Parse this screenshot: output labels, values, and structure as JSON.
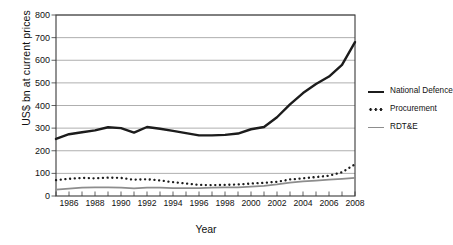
{
  "chart_data": {
    "type": "line",
    "title": "",
    "xlabel": "Year",
    "ylabel": "US$ bn at current prices",
    "ylim": [
      0,
      800
    ],
    "yticks": [
      0,
      100,
      200,
      300,
      400,
      500,
      600,
      700,
      800
    ],
    "xlim": [
      1985,
      2008
    ],
    "xticks": [
      1986,
      1988,
      1990,
      1992,
      1994,
      1996,
      1998,
      2000,
      2002,
      2004,
      2006,
      2008
    ],
    "x": [
      1985,
      1986,
      1987,
      1988,
      1989,
      1990,
      1991,
      1992,
      1993,
      1994,
      1995,
      1996,
      1997,
      1998,
      1999,
      2000,
      2001,
      2002,
      2003,
      2004,
      2005,
      2006,
      2007,
      2008
    ],
    "grid": "horizontal",
    "legend_position": "right",
    "series": [
      {
        "name": "National Defence",
        "style": "solid-thick",
        "color": "#1c1c1c",
        "values": [
          252,
          273,
          282,
          290,
          304,
          300,
          280,
          305,
          297,
          288,
          278,
          268,
          268,
          270,
          276,
          295,
          305,
          348,
          405,
          455,
          495,
          528,
          580,
          680
        ]
      },
      {
        "name": "Procurement",
        "style": "dotted",
        "color": "#1c1c1c",
        "values": [
          70,
          76,
          80,
          78,
          81,
          80,
          72,
          74,
          69,
          61,
          55,
          49,
          48,
          49,
          51,
          55,
          58,
          63,
          73,
          78,
          84,
          90,
          105,
          140
        ]
      },
      {
        "name": "RDT&E",
        "style": "solid-grey",
        "color": "#8d8d8d",
        "values": [
          28,
          33,
          37,
          38,
          38,
          37,
          34,
          37,
          37,
          35,
          35,
          35,
          37,
          38,
          38,
          41,
          45,
          51,
          59,
          65,
          68,
          72,
          76,
          80
        ]
      }
    ]
  },
  "axes": {
    "ylabel": "US$ bn at current prices",
    "xlabel": "Year"
  },
  "legend": {
    "items": [
      {
        "label": "National Defence",
        "swatch": "solid-thick-line-icon"
      },
      {
        "label": "Procurement",
        "swatch": "dotted-line-icon"
      },
      {
        "label": "RDT&E",
        "swatch": "solid-grey-line-icon"
      }
    ]
  }
}
